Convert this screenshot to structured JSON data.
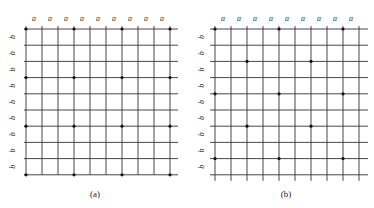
{
  "figure": {
    "width": 374,
    "height": 208,
    "line_color": "#333333",
    "dot_color": "#111111",
    "panels": [
      {
        "id": "a",
        "caption": "(a)",
        "caption_x": 95,
        "caption_y": 197,
        "columns": 10,
        "rows": 10,
        "x0": 26,
        "y0": 29,
        "dx": 16,
        "dy": 16.2,
        "h_line_extend_left": 2,
        "h_line_extend_right": 8,
        "v_line_extend_top": 3,
        "v_line_extend_bottom": 0,
        "col_label": "a",
        "row_label": "b",
        "dots": [
          [
            0,
            0
          ],
          [
            0,
            3
          ],
          [
            0,
            6
          ],
          [
            0,
            9
          ],
          [
            3,
            0
          ],
          [
            3,
            3
          ],
          [
            3,
            6
          ],
          [
            3,
            9
          ],
          [
            6,
            0
          ],
          [
            6,
            3
          ],
          [
            6,
            6
          ],
          [
            6,
            9
          ],
          [
            9,
            0
          ],
          [
            9,
            3
          ],
          [
            9,
            6
          ],
          [
            9,
            9
          ]
        ]
      },
      {
        "id": "b",
        "caption": "(b)",
        "caption_x": 286,
        "caption_y": 197,
        "columns": 10,
        "rows": 10,
        "x0": 215,
        "y0": 29,
        "dx": 16,
        "dy": 16.2,
        "h_line_extend_left": 5,
        "h_line_extend_right": 9,
        "v_line_extend_top": 3,
        "v_line_extend_bottom": 6,
        "col_label": "a",
        "row_label": "b",
        "dots": [
          [
            0,
            0
          ],
          [
            0,
            4
          ],
          [
            0,
            8
          ],
          [
            2,
            2
          ],
          [
            2,
            6
          ],
          [
            4,
            0
          ],
          [
            4,
            4
          ],
          [
            4,
            8
          ],
          [
            6,
            2
          ],
          [
            6,
            6
          ],
          [
            8,
            0
          ],
          [
            8,
            4
          ],
          [
            8,
            8
          ]
        ]
      }
    ]
  }
}
